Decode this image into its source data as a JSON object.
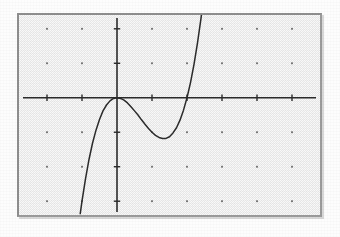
{
  "figure": {
    "kind": "graphing-calculator-screen",
    "caption": "",
    "screen_border_color": "#8e8e8e",
    "screen_background_color": "#f2f2f2",
    "ink_color": "#2b2b2b"
  },
  "chart_data": {
    "type": "line",
    "title": "",
    "xlabel": "",
    "ylabel": "",
    "xlim": [
      -2.8,
      5.8
    ],
    "ylim": [
      -3.4,
      2.4
    ],
    "grid": true,
    "grid_style": "dots",
    "grid_spacing_x": 1,
    "grid_spacing_y": 1,
    "axis_tick_spacing_x": 1,
    "axis_tick_spacing_y": 1,
    "legend": null,
    "legend_position": "none",
    "series": [
      {
        "name": "cubic",
        "expression": "y = x^3 - 2x^2",
        "roots": [
          0,
          0,
          2
        ],
        "local_max": {
          "x": 0,
          "y": 0
        },
        "local_min": {
          "x": 1.33,
          "y": -1.19
        },
        "x": [
          -1.05,
          -1.0,
          -0.9,
          -0.8,
          -0.7,
          -0.6,
          -0.5,
          -0.4,
          -0.3,
          -0.2,
          -0.1,
          0.0,
          0.1,
          0.2,
          0.3,
          0.4,
          0.5,
          0.6,
          0.7,
          0.8,
          0.9,
          1.0,
          1.1,
          1.2,
          1.3,
          1.4,
          1.5,
          1.6,
          1.7,
          1.8,
          1.9,
          2.0,
          2.1,
          2.2,
          2.3,
          2.4,
          2.5,
          2.6,
          2.7,
          2.75
        ],
        "y": [
          -3.36,
          -3.0,
          -2.35,
          -1.79,
          -1.32,
          -0.94,
          -0.63,
          -0.38,
          -0.21,
          -0.09,
          -0.02,
          0.0,
          -0.02,
          -0.07,
          -0.15,
          -0.26,
          -0.38,
          -0.5,
          -0.64,
          -0.77,
          -0.89,
          -1.0,
          -1.09,
          -1.15,
          -1.18,
          -1.18,
          -1.13,
          -1.02,
          -0.87,
          -0.65,
          -0.36,
          0.0,
          0.44,
          0.97,
          1.59,
          2.3,
          3.13,
          4.06,
          5.1,
          5.67
        ]
      }
    ]
  }
}
